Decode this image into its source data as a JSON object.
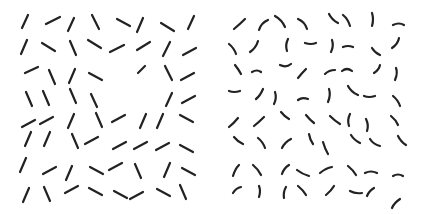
{
  "stimulus": {
    "stroke_color": "#222222",
    "background": "#ffffff",
    "left_panel": {
      "kind": "straight-segments",
      "segments": [
        [
          22,
          28,
          28,
          15
        ],
        [
          46,
          24,
          60,
          17
        ],
        [
          68,
          31,
          74,
          18
        ],
        [
          92,
          15,
          99,
          29
        ],
        [
          117,
          19,
          130,
          26
        ],
        [
          137,
          32,
          143,
          18
        ],
        [
          161,
          23,
          174,
          31
        ],
        [
          188,
          29,
          194,
          16
        ],
        [
          21,
          54,
          27,
          40
        ],
        [
          42,
          43,
          55,
          51
        ],
        [
          70,
          41,
          76,
          55
        ],
        [
          88,
          40,
          101,
          48
        ],
        [
          110,
          52,
          124,
          45
        ],
        [
          137,
          50,
          150,
          42
        ],
        [
          163,
          56,
          170,
          42
        ],
        [
          183,
          55,
          196,
          48
        ],
        [
          25,
          73,
          38,
          67
        ],
        [
          49,
          70,
          55,
          84
        ],
        [
          69,
          83,
          75,
          69
        ],
        [
          89,
          73,
          102,
          80
        ],
        [
          138,
          73,
          145,
          66
        ],
        [
          165,
          66,
          172,
          80
        ],
        [
          181,
          80,
          194,
          73
        ],
        [
          26,
          92,
          32,
          106
        ],
        [
          43,
          91,
          49,
          105
        ],
        [
          70,
          89,
          76,
          103
        ],
        [
          91,
          94,
          97,
          107
        ],
        [
          166,
          106,
          172,
          93
        ],
        [
          182,
          103,
          195,
          96
        ],
        [
          22,
          127,
          35,
          120
        ],
        [
          40,
          124,
          53,
          117
        ],
        [
          68,
          128,
          74,
          114
        ],
        [
          96,
          113,
          102,
          127
        ],
        [
          112,
          122,
          125,
          115
        ],
        [
          140,
          128,
          146,
          114
        ],
        [
          157,
          128,
          163,
          114
        ],
        [
          180,
          115,
          193,
          122
        ],
        [
          25,
          146,
          31,
          132
        ],
        [
          44,
          146,
          50,
          132
        ],
        [
          72,
          134,
          78,
          148
        ],
        [
          85,
          144,
          98,
          137
        ],
        [
          113,
          149,
          126,
          142
        ],
        [
          134,
          149,
          147,
          142
        ],
        [
          156,
          150,
          169,
          143
        ],
        [
          180,
          145,
          193,
          152
        ],
        [
          20,
          172,
          26,
          158
        ],
        [
          43,
          174,
          56,
          167
        ],
        [
          66,
          180,
          72,
          166
        ],
        [
          90,
          167,
          103,
          174
        ],
        [
          109,
          170,
          122,
          163
        ],
        [
          135,
          164,
          141,
          178
        ],
        [
          164,
          177,
          170,
          163
        ],
        [
          182,
          168,
          195,
          175
        ],
        [
          23,
          202,
          29,
          188
        ],
        [
          44,
          187,
          50,
          201
        ],
        [
          65,
          193,
          78,
          186
        ],
        [
          89,
          188,
          102,
          195
        ],
        [
          114,
          191,
          127,
          198
        ],
        [
          130,
          199,
          143,
          192
        ],
        [
          157,
          189,
          170,
          196
        ],
        [
          180,
          185,
          186,
          199
        ]
      ]
    },
    "right_panel": {
      "kind": "curved-segments",
      "curves": [
        "M234 29 Q240 24 245 19",
        "M259 30 Q261 23 268 20",
        "M275 16 Q282 20 285 27",
        "M298 19 Q305 22 307 29",
        "M329 14 Q332 20 338 23",
        "M343 15 Q348 19 350 26",
        "M372 13 Q374 19 372 26",
        "M393 25 Q399 22 404 25",
        "M229 44 Q234 48 236 54",
        "M250 52 Q256 48 258 41",
        "M288 39 Q285 45 287 51",
        "M305 43 Q311 45 316 43",
        "M332 40 Q334 46 331 52",
        "M343 47 Q348 45 353 47",
        "M372 48 Q375 53 380 55",
        "M392 48 Q398 44 399 38",
        "M235 65 Q239 70 241 74",
        "M252 72 Q257 69 261 72",
        "M280 65 Q286 68 291 64",
        "M298 78 Q302 73 306 69",
        "M325 74 Q329 70 335 70",
        "M342 71 Q347 67 352 71",
        "M374 73 Q379 70 380 65",
        "M396 68 Q398 73 395 80",
        "M229 91 Q234 93 240 91",
        "M256 99 Q260 96 263 89",
        "M275 92 Q277 98 274 104",
        "M298 100 Q302 97 308 99",
        "M329 89 Q331 95 328 102",
        "M348 86 Q351 92 358 95",
        "M364 96 Q369 98 375 96",
        "M393 96 Q398 100 400 106",
        "M229 127 Q234 123 238 118",
        "M254 126 Q259 122 264 117",
        "M281 112 Q285 117 289 119",
        "M306 115 Q310 120 314 123",
        "M330 116 Q335 121 340 124",
        "M350 114 Q347 120 349 126",
        "M366 119 Q369 125 367 131",
        "M391 116 Q396 120 398 125",
        "M234 137 Q238 142 243 144",
        "M258 138 Q263 142 265 148",
        "M282 148 Q285 142 291 139",
        "M309 134 Q310 140 313 144",
        "M323 142 Q325 149 328 154",
        "M351 135 Q354 140 360 143",
        "M370 139 Q373 144 380 146",
        "M398 136 Q401 142 406 145",
        "M233 176 Q235 169 239 165",
        "M253 165 Q258 169 261 175",
        "M282 174 Q284 168 289 165",
        "M297 170 Q302 174 309 176",
        "M320 173 Q326 168 332 167",
        "M348 166 Q353 170 356 175",
        "M365 173 Q371 170 377 173",
        "M393 176 Q398 173 403 176",
        "M233 193 Q236 188 241 187",
        "M259 186 Q261 191 259 197",
        "M286 187 Q283 192 284 198",
        "M298 186 Q303 190 306 195",
        "M326 195 Q331 191 334 186",
        "M350 191 Q355 194 362 193",
        "M367 196 Q369 191 374 188",
        "M392 208 Q394 203 400 199"
      ]
    }
  }
}
